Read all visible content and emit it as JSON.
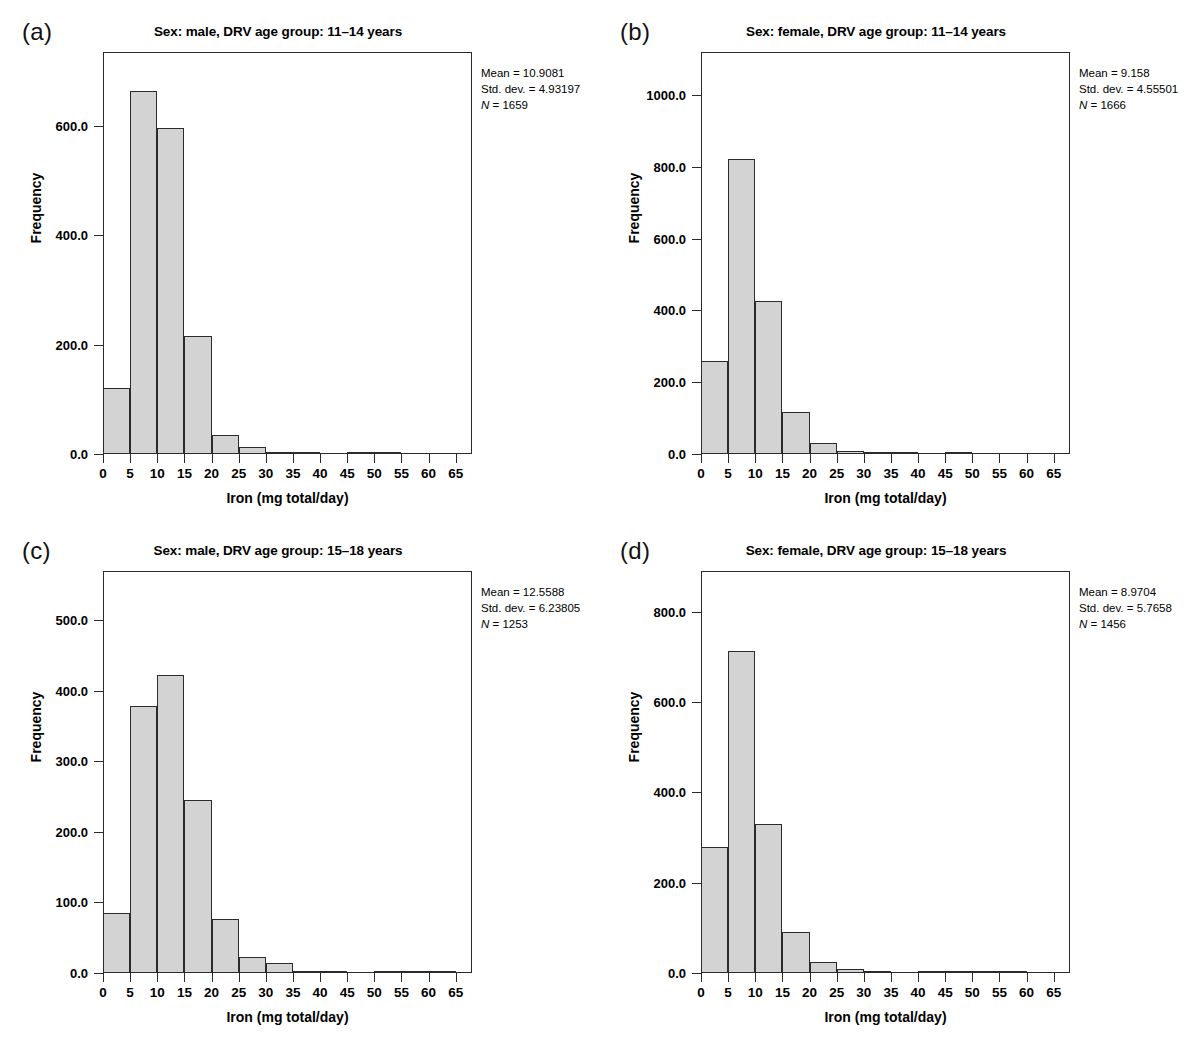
{
  "figure": {
    "panels": [
      {
        "letter": "(a)",
        "title": "Sex: male, DRV age group: 11–14 years",
        "stats": {
          "mean": "Mean = 10.9081",
          "sd": "Std. dev. = 4.93197",
          "n_label": "N",
          "n_value": " = 1659"
        },
        "axes": {
          "xlabel": "Iron (mg total/day)",
          "ylabel": "Frequency",
          "xticks": [
            "0",
            "5",
            "10",
            "15",
            "20",
            "25",
            "30",
            "35",
            "40",
            "45",
            "50",
            "55",
            "60",
            "65"
          ],
          "yticks": [
            "0.0",
            "200.0",
            "400.0",
            "600.0"
          ]
        }
      },
      {
        "letter": "(b)",
        "title": "Sex: female, DRV age group: 11–14 years",
        "stats": {
          "mean": "Mean = 9.158",
          "sd": "Std. dev. = 4.55501",
          "n_label": "N",
          "n_value": " = 1666"
        },
        "axes": {
          "xlabel": "Iron (mg total/day)",
          "ylabel": "Frequency",
          "xticks": [
            "0",
            "5",
            "10",
            "15",
            "20",
            "25",
            "30",
            "35",
            "40",
            "45",
            "50",
            "55",
            "60",
            "65"
          ],
          "yticks": [
            "0.0",
            "200.0",
            "400.0",
            "600.0",
            "800.0",
            "1000.0"
          ]
        }
      },
      {
        "letter": "(c)",
        "title": "Sex: male, DRV age group: 15–18 years",
        "stats": {
          "mean": "Mean = 12.5588",
          "sd": "Std. dev. = 6.23805",
          "n_label": "N",
          "n_value": " = 1253"
        },
        "axes": {
          "xlabel": "Iron (mg total/day)",
          "ylabel": "Frequency",
          "xticks": [
            "0",
            "5",
            "10",
            "15",
            "20",
            "25",
            "30",
            "35",
            "40",
            "45",
            "50",
            "55",
            "60",
            "65"
          ],
          "yticks": [
            "0.0",
            "100.0",
            "200.0",
            "300.0",
            "400.0",
            "500.0"
          ]
        }
      },
      {
        "letter": "(d)",
        "title": "Sex: female, DRV age group: 15–18 years",
        "stats": {
          "mean": "Mean = 8.9704",
          "sd": "Std. dev. = 5.7658",
          "n_label": "N",
          "n_value": " = 1456"
        },
        "axes": {
          "xlabel": "Iron (mg total/day)",
          "ylabel": "Frequency",
          "xticks": [
            "0",
            "5",
            "10",
            "15",
            "20",
            "25",
            "30",
            "35",
            "40",
            "45",
            "50",
            "55",
            "60",
            "65"
          ],
          "yticks": [
            "0.0",
            "200.0",
            "400.0",
            "600.0",
            "800.0"
          ]
        }
      }
    ]
  },
  "chart_data": [
    {
      "type": "bar",
      "panel": "(a)",
      "title": "Sex: male, DRV age group: 11–14 years",
      "xlabel": "Iron (mg total/day)",
      "ylabel": "Frequency",
      "bin_width": 5,
      "bin_starts": [
        0,
        5,
        10,
        15,
        20,
        25,
        30,
        35,
        40,
        45,
        50,
        55,
        60
      ],
      "categories": [
        "0–5",
        "5–10",
        "10–15",
        "15–20",
        "20–25",
        "25–30",
        "30–35",
        "35–40",
        "40–45",
        "45–50",
        "50–55",
        "55–60",
        "60–65"
      ],
      "values": [
        120,
        664,
        596,
        216,
        35,
        12,
        4,
        2,
        0,
        1,
        1,
        0,
        0
      ],
      "xlim": [
        0,
        68
      ],
      "ylim": [
        0,
        735
      ],
      "yticks": [
        0,
        200,
        400,
        600
      ],
      "xticks": [
        0,
        5,
        10,
        15,
        20,
        25,
        30,
        35,
        40,
        45,
        50,
        55,
        60,
        65
      ],
      "grid": false,
      "legend": false,
      "annotations": [
        "Mean = 10.9081",
        "Std. dev. = 4.93197",
        "N = 1659"
      ]
    },
    {
      "type": "bar",
      "panel": "(b)",
      "title": "Sex: female, DRV age group: 11–14 years",
      "xlabel": "Iron (mg total/day)",
      "ylabel": "Frequency",
      "bin_width": 5,
      "bin_starts": [
        0,
        5,
        10,
        15,
        20,
        25,
        30,
        35,
        40,
        45,
        50,
        55,
        60
      ],
      "categories": [
        "0–5",
        "5–10",
        "10–15",
        "15–20",
        "20–25",
        "25–30",
        "30–35",
        "35–40",
        "40–45",
        "45–50",
        "50–55",
        "55–60",
        "60–65"
      ],
      "values": [
        258,
        822,
        426,
        118,
        30,
        8,
        2,
        2,
        0,
        5,
        0,
        0,
        0
      ],
      "xlim": [
        0,
        68
      ],
      "ylim": [
        0,
        1120
      ],
      "yticks": [
        0,
        200,
        400,
        600,
        800,
        1000
      ],
      "xticks": [
        0,
        5,
        10,
        15,
        20,
        25,
        30,
        35,
        40,
        45,
        50,
        55,
        60,
        65
      ],
      "grid": false,
      "legend": false,
      "annotations": [
        "Mean = 9.158",
        "Std. dev. = 4.55501",
        "N = 1666"
      ]
    },
    {
      "type": "bar",
      "panel": "(c)",
      "title": "Sex: male, DRV age group: 15–18 years",
      "xlabel": "Iron (mg total/day)",
      "ylabel": "Frequency",
      "bin_width": 5,
      "bin_starts": [
        0,
        5,
        10,
        15,
        20,
        25,
        30,
        35,
        40,
        45,
        50,
        55,
        60
      ],
      "categories": [
        "0–5",
        "5–10",
        "10–15",
        "15–20",
        "20–25",
        "25–30",
        "30–35",
        "35–40",
        "40–45",
        "45–50",
        "50–55",
        "55–60",
        "60–65"
      ],
      "values": [
        85,
        379,
        423,
        245,
        76,
        23,
        14,
        2,
        2,
        0,
        2,
        2,
        2
      ],
      "xlim": [
        0,
        68
      ],
      "ylim": [
        0,
        570
      ],
      "yticks": [
        0,
        100,
        200,
        300,
        400,
        500
      ],
      "xticks": [
        0,
        5,
        10,
        15,
        20,
        25,
        30,
        35,
        40,
        45,
        50,
        55,
        60,
        65
      ],
      "grid": false,
      "legend": false,
      "annotations": [
        "Mean = 12.5588",
        "Std. dev. = 6.23805",
        "N = 1253"
      ]
    },
    {
      "type": "bar",
      "panel": "(d)",
      "title": "Sex: female, DRV age group: 15–18 years",
      "xlabel": "Iron (mg total/day)",
      "ylabel": "Frequency",
      "bin_width": 5,
      "bin_starts": [
        0,
        5,
        10,
        15,
        20,
        25,
        30,
        35,
        40,
        45,
        50,
        55,
        60
      ],
      "categories": [
        "0–5",
        "5–10",
        "10–15",
        "15–20",
        "20–25",
        "25–30",
        "30–35",
        "35–40",
        "40–45",
        "45–50",
        "50–55",
        "55–60",
        "60–65"
      ],
      "values": [
        280,
        712,
        330,
        90,
        25,
        8,
        2,
        0,
        3,
        3,
        3,
        3,
        0
      ],
      "xlim": [
        0,
        68
      ],
      "ylim": [
        0,
        890
      ],
      "yticks": [
        0,
        200,
        400,
        600,
        800
      ],
      "xticks": [
        0,
        5,
        10,
        15,
        20,
        25,
        30,
        35,
        40,
        45,
        50,
        55,
        60,
        65
      ],
      "grid": false,
      "legend": false,
      "annotations": [
        "Mean = 8.9704",
        "Std. dev. = 5.7658",
        "N = 1456"
      ]
    }
  ],
  "style": {
    "bar_fill": "#d3d3d3",
    "bar_stroke": "#2b2b2b",
    "background": "#ffffff",
    "text": "#000000"
  }
}
